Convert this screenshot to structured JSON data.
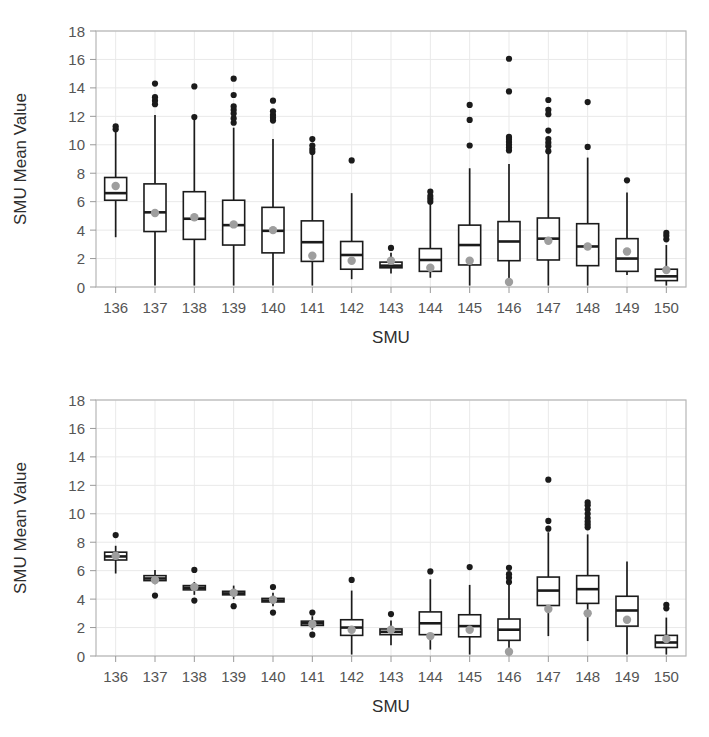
{
  "chart_data": [
    {
      "id": "top",
      "type": "box",
      "title": "",
      "xlabel": "SMU",
      "ylabel": "SMU Mean Value",
      "ylim": [
        0,
        18
      ],
      "yticks": [
        0,
        2,
        4,
        6,
        8,
        10,
        12,
        14,
        16,
        18
      ],
      "grid": true,
      "legend": "none",
      "categories": [
        "136",
        "137",
        "138",
        "139",
        "140",
        "141",
        "142",
        "143",
        "144",
        "145",
        "146",
        "147",
        "148",
        "149",
        "150"
      ],
      "boxes": [
        {
          "category": "136",
          "lower_whisker": 3.5,
          "q1": 6.1,
          "median": 6.6,
          "q3": 7.7,
          "upper_whisker": 10.9,
          "mean": 7.1,
          "outliers": [
            11.1,
            11.3
          ]
        },
        {
          "category": "137",
          "lower_whisker": 0.1,
          "q1": 3.9,
          "median": 5.25,
          "q3": 7.25,
          "upper_whisker": 12.1,
          "mean": 5.2,
          "outliers": [
            12.85,
            13.1,
            13.35,
            14.3
          ]
        },
        {
          "category": "138",
          "lower_whisker": 0.1,
          "q1": 3.35,
          "median": 4.8,
          "q3": 6.7,
          "upper_whisker": 11.8,
          "mean": 4.9,
          "outliers": [
            11.95,
            14.1
          ]
        },
        {
          "category": "139",
          "lower_whisker": 0.1,
          "q1": 2.95,
          "median": 4.35,
          "q3": 6.1,
          "upper_whisker": 11.2,
          "mean": 4.4,
          "outliers": [
            11.55,
            11.85,
            12.2,
            12.45,
            12.7,
            13.5,
            14.65
          ]
        },
        {
          "category": "140",
          "lower_whisker": 0.1,
          "q1": 2.4,
          "median": 3.95,
          "q3": 5.6,
          "upper_whisker": 10.4,
          "mean": 4.0,
          "outliers": [
            11.7,
            11.9,
            12.1,
            12.35,
            13.1
          ]
        },
        {
          "category": "141",
          "lower_whisker": 0.1,
          "q1": 1.8,
          "median": 3.15,
          "q3": 4.65,
          "upper_whisker": 9.3,
          "mean": 2.2,
          "outliers": [
            9.5,
            9.7,
            9.95,
            10.4
          ]
        },
        {
          "category": "142",
          "lower_whisker": 0.55,
          "q1": 1.25,
          "median": 2.25,
          "q3": 3.2,
          "upper_whisker": 6.6,
          "mean": 1.85,
          "outliers": [
            8.9
          ]
        },
        {
          "category": "143",
          "lower_whisker": 0.95,
          "q1": 1.35,
          "median": 1.5,
          "q3": 1.75,
          "upper_whisker": 2.4,
          "mean": 1.85,
          "outliers": [
            2.75
          ]
        },
        {
          "category": "144",
          "lower_whisker": 0.65,
          "q1": 1.1,
          "median": 1.9,
          "q3": 2.7,
          "upper_whisker": 5.85,
          "mean": 1.35,
          "outliers": [
            6.0,
            6.2,
            6.4,
            6.7
          ]
        },
        {
          "category": "145",
          "lower_whisker": 0.1,
          "q1": 1.55,
          "median": 2.95,
          "q3": 4.35,
          "upper_whisker": 8.35,
          "mean": 1.85,
          "outliers": [
            9.95,
            11.75,
            12.8
          ]
        },
        {
          "category": "146",
          "lower_whisker": 0.1,
          "q1": 1.85,
          "median": 3.2,
          "q3": 4.6,
          "upper_whisker": 8.65,
          "mean": 0.35,
          "outliers": [
            9.6,
            9.8,
            10.0,
            10.2,
            10.4,
            10.55,
            13.75,
            16.05
          ]
        },
        {
          "category": "147",
          "lower_whisker": 0.1,
          "q1": 1.9,
          "median": 3.4,
          "q3": 4.85,
          "upper_whisker": 9.4,
          "mean": 3.25,
          "outliers": [
            9.55,
            9.9,
            10.15,
            10.4,
            11.0,
            12.15,
            12.45,
            13.15
          ]
        },
        {
          "category": "148",
          "lower_whisker": 0.1,
          "q1": 1.5,
          "median": 2.85,
          "q3": 4.45,
          "upper_whisker": 9.1,
          "mean": 2.85,
          "outliers": [
            9.85,
            13.0
          ]
        },
        {
          "category": "149",
          "lower_whisker": 0.85,
          "q1": 1.1,
          "median": 2.0,
          "q3": 3.4,
          "upper_whisker": 6.65,
          "mean": 2.5,
          "outliers": [
            7.5
          ]
        },
        {
          "category": "150",
          "lower_whisker": 0.1,
          "q1": 0.45,
          "median": 0.75,
          "q3": 1.25,
          "upper_whisker": 2.95,
          "mean": 1.2,
          "outliers": [
            3.35,
            3.6,
            3.8
          ]
        }
      ]
    },
    {
      "id": "bottom",
      "type": "box",
      "title": "",
      "xlabel": "SMU",
      "ylabel": "SMU Mean Value",
      "ylim": [
        0,
        18
      ],
      "yticks": [
        0,
        2,
        4,
        6,
        8,
        10,
        12,
        14,
        16,
        18
      ],
      "grid": true,
      "legend": "none",
      "categories": [
        "136",
        "137",
        "138",
        "139",
        "140",
        "141",
        "142",
        "143",
        "144",
        "145",
        "146",
        "147",
        "148",
        "149",
        "150"
      ],
      "boxes": [
        {
          "category": "136",
          "lower_whisker": 5.8,
          "q1": 6.75,
          "median": 7.0,
          "q3": 7.3,
          "upper_whisker": 7.75,
          "mean": 7.05,
          "outliers": [
            8.5
          ]
        },
        {
          "category": "137",
          "lower_whisker": 5.05,
          "q1": 5.3,
          "median": 5.45,
          "q3": 5.65,
          "upper_whisker": 6.05,
          "mean": 5.35,
          "outliers": [
            4.25
          ]
        },
        {
          "category": "138",
          "lower_whisker": 4.3,
          "q1": 4.65,
          "median": 4.8,
          "q3": 4.95,
          "upper_whisker": 5.2,
          "mean": 4.85,
          "outliers": [
            3.9,
            6.05
          ]
        },
        {
          "category": "139",
          "lower_whisker": 4.0,
          "q1": 4.3,
          "median": 4.4,
          "q3": 4.55,
          "upper_whisker": 4.95,
          "mean": 4.45,
          "outliers": [
            3.5
          ]
        },
        {
          "category": "140",
          "lower_whisker": 3.5,
          "q1": 3.8,
          "median": 3.9,
          "q3": 4.05,
          "upper_whisker": 4.45,
          "mean": 3.95,
          "outliers": [
            3.05,
            4.85
          ]
        },
        {
          "category": "141",
          "lower_whisker": 1.85,
          "q1": 2.15,
          "median": 2.3,
          "q3": 2.45,
          "upper_whisker": 2.8,
          "mean": 2.25,
          "outliers": [
            1.5,
            3.05
          ]
        },
        {
          "category": "142",
          "lower_whisker": 0.1,
          "q1": 1.45,
          "median": 2.0,
          "q3": 2.55,
          "upper_whisker": 4.6,
          "mean": 1.85,
          "outliers": [
            5.35
          ]
        },
        {
          "category": "143",
          "lower_whisker": 0.75,
          "q1": 1.5,
          "median": 1.7,
          "q3": 1.9,
          "upper_whisker": 2.5,
          "mean": 1.85,
          "outliers": [
            2.95
          ]
        },
        {
          "category": "144",
          "lower_whisker": 0.45,
          "q1": 1.5,
          "median": 2.3,
          "q3": 3.1,
          "upper_whisker": 5.4,
          "mean": 1.4,
          "outliers": [
            5.95
          ]
        },
        {
          "category": "145",
          "lower_whisker": 0.1,
          "q1": 1.35,
          "median": 2.1,
          "q3": 2.9,
          "upper_whisker": 5.0,
          "mean": 1.85,
          "outliers": [
            6.25
          ]
        },
        {
          "category": "146",
          "lower_whisker": 0.1,
          "q1": 1.1,
          "median": 1.85,
          "q3": 2.6,
          "upper_whisker": 5.0,
          "mean": 0.3,
          "outliers": [
            5.2,
            5.5,
            5.75,
            6.2
          ]
        },
        {
          "category": "147",
          "lower_whisker": 1.4,
          "q1": 3.55,
          "median": 4.6,
          "q3": 5.55,
          "upper_whisker": 8.7,
          "mean": 3.3,
          "outliers": [
            8.95,
            9.5,
            12.4
          ]
        },
        {
          "category": "148",
          "lower_whisker": 1.05,
          "q1": 3.7,
          "median": 4.7,
          "q3": 5.65,
          "upper_whisker": 8.55,
          "mean": 3.0,
          "outliers": [
            9.05,
            9.25,
            9.45,
            9.7,
            10.0,
            10.3,
            10.6,
            10.8
          ]
        },
        {
          "category": "149",
          "lower_whisker": 0.1,
          "q1": 2.1,
          "median": 3.2,
          "q3": 4.2,
          "upper_whisker": 6.65,
          "mean": 2.55,
          "outliers": []
        },
        {
          "category": "150",
          "lower_whisker": 0.1,
          "q1": 0.6,
          "median": 0.95,
          "q3": 1.45,
          "upper_whisker": 2.7,
          "mean": 1.2,
          "outliers": [
            3.35,
            3.6
          ]
        }
      ]
    }
  ],
  "colors": {
    "box_stroke": "#1b1b1b",
    "box_fill": "#ffffff",
    "mean_dot": "#9e9e9e",
    "outlier": "#1b1b1b",
    "grid": "#e9e9e9",
    "panel_border": "#b6b6b6",
    "tick_label": "#555555",
    "axis_title": "#2e2e2e",
    "background": "#ffffff"
  }
}
